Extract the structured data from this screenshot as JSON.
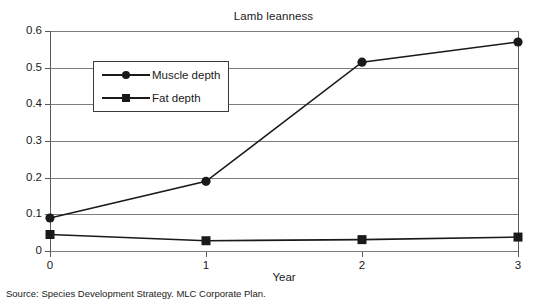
{
  "chart_data": {
    "type": "line",
    "title": "Lamb leanness",
    "xlabel": "Year",
    "ylabel": "",
    "x": [
      0,
      1,
      2,
      3
    ],
    "xtick_labels": [
      "0",
      "1",
      "2",
      "3"
    ],
    "ytick_labels": [
      "0",
      "0.1",
      "0.2",
      "0.3",
      "0.4",
      "0.5",
      "0.6"
    ],
    "ylim": [
      0,
      0.6
    ],
    "xlim": [
      0,
      3
    ],
    "grid": true,
    "legend_position": "upper left",
    "series": [
      {
        "name": "Muscle depth",
        "marker": "circle",
        "color": "#1a1a1a",
        "values": [
          0.09,
          0.19,
          0.515,
          0.57
        ]
      },
      {
        "name": "Fat depth",
        "marker": "square",
        "color": "#1a1a1a",
        "values": [
          0.045,
          0.028,
          0.031,
          0.038
        ]
      }
    ],
    "annotations": [
      "Source: Species Development Strategy. MLC Corporate Plan."
    ]
  },
  "figure": {
    "title": "Lamb leanness",
    "xaxis_title": "Year",
    "source_note": "Source: Species Development Strategy. MLC Corporate Plan.",
    "legend": {
      "items": [
        {
          "label": "Muscle depth",
          "marker": "circle-marker-icon"
        },
        {
          "label": "Fat depth",
          "marker": "square-marker-icon"
        }
      ]
    },
    "ytick_labels": [
      "0.6",
      "0.5",
      "0.4",
      "0.3",
      "0.2",
      "0.1",
      "0"
    ],
    "xtick_labels": [
      "0",
      "1",
      "2",
      "3"
    ],
    "colors": {
      "line": "#1a1a1a",
      "grid": "#7d7d7d",
      "axis": "#5a5a5a",
      "background": "#ffffff"
    }
  }
}
